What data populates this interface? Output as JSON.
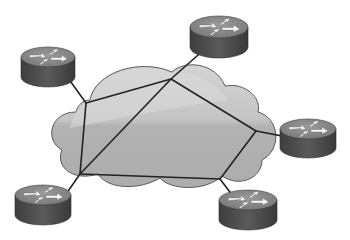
{
  "diagram": {
    "colors": {
      "background": "#ffffff",
      "cloud_fill": "#b8b8b8",
      "cloud_highlight": "#d6d6d6",
      "cloud_stroke": "#555555",
      "link": "#222222",
      "router_top": "#8a8a8a",
      "router_side": "#4e4e4e",
      "router_arrow": "#f4f4f4"
    },
    "cloud": {
      "label": "network-cloud"
    },
    "internal_nodes": [
      {
        "id": "A",
        "x": 86,
        "y": 103
      },
      {
        "id": "B",
        "x": 171,
        "y": 79
      },
      {
        "id": "C",
        "x": 256,
        "y": 131
      },
      {
        "id": "D",
        "x": 220,
        "y": 179
      },
      {
        "id": "E",
        "x": 80,
        "y": 174
      }
    ],
    "internal_links": [
      [
        "A",
        "B"
      ],
      [
        "B",
        "C"
      ],
      [
        "C",
        "D"
      ],
      [
        "D",
        "E"
      ],
      [
        "E",
        "A"
      ],
      [
        "E",
        "B"
      ]
    ],
    "routers": [
      {
        "id": "router-top-left",
        "cx": 48,
        "cy": 57,
        "rx": 27,
        "ry": 10,
        "h": 20,
        "attach": "A"
      },
      {
        "id": "router-top",
        "cx": 219,
        "cy": 27,
        "rx": 29,
        "ry": 11,
        "h": 20,
        "attach": "B"
      },
      {
        "id": "router-right",
        "cx": 308,
        "cy": 129,
        "rx": 28,
        "ry": 10,
        "h": 19,
        "attach": "C"
      },
      {
        "id": "router-bottom-left",
        "cx": 43,
        "cy": 195,
        "rx": 28,
        "ry": 10,
        "h": 20,
        "attach": "E"
      },
      {
        "id": "router-bottom-right",
        "cx": 248,
        "cy": 200,
        "rx": 29,
        "ry": 10,
        "h": 20,
        "attach": "D"
      }
    ]
  }
}
